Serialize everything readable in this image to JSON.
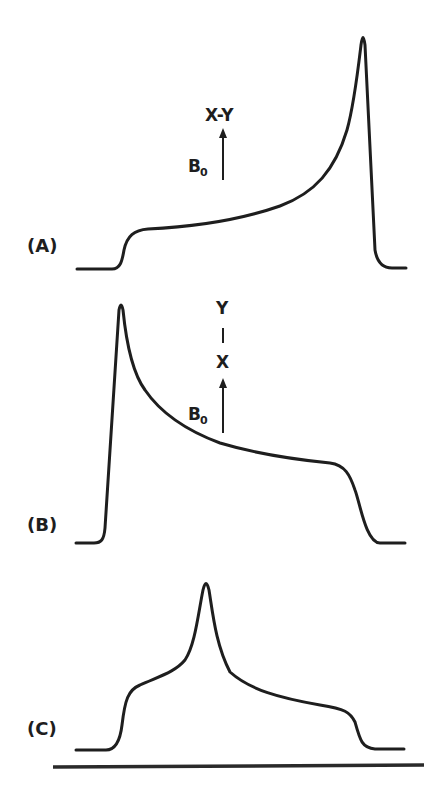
{
  "figure": {
    "panels": [
      {
        "id": "A",
        "label": "(A)",
        "orientation_label": "X-Y",
        "field_label": "B",
        "field_subscript": "0",
        "description": "Axially symmetric powder pattern with sharp peak at high-field (right) edge"
      },
      {
        "id": "B",
        "label": "(B)",
        "orientation_top": "Y",
        "orientation_bond": "|",
        "orientation_bottom": "X",
        "field_label": "B",
        "field_subscript": "0",
        "description": "Axially symmetric powder pattern with sharp peak at low-field (left) edge"
      },
      {
        "id": "C",
        "label": "(C)",
        "description": "Non-axially symmetric powder pattern with central peak and two shoulders"
      }
    ],
    "colors": {
      "ink": "#1e1e1e",
      "background": "#ffffff"
    }
  }
}
